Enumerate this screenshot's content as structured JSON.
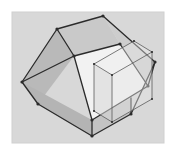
{
  "figure": {
    "title": "3D wireframe illustration of an open box with a smaller transparent box",
    "type": "3d-line-drawing",
    "width": 177,
    "height": 155,
    "background_color": "#ffffff",
    "plot_background_color": "#d9d9d9",
    "frame": {
      "x": 12,
      "y": 12,
      "width": 152,
      "height": 131,
      "fill": "#d8d8d8",
      "border_color": "#d0d0d0"
    },
    "stroke": {
      "color": "#2b2b2b",
      "width": 1.3,
      "thin_color": "#5a5a5a",
      "thin_width": 0.8
    },
    "shapes": [
      {
        "name": "large-open-box",
        "label": "Large open box",
        "faces": [
          {
            "name": "outer-left-face",
            "fill": "#b9b9b9",
            "points": "22,82 57,29 74,56 38,104"
          },
          {
            "name": "outer-front-left-face",
            "fill": "#b4b4b4",
            "points": "22,82 38,104 92,136 92,120"
          },
          {
            "name": "inner-back-left-wall",
            "fill": "#c9c9c9",
            "points": "57,29 103,16 120,44 74,56"
          },
          {
            "name": "inner-floor",
            "fill": "#f2f2f2",
            "points": "74,56 120,44 148,86 92,120"
          },
          {
            "name": "outer-right-face",
            "fill": "#cdcdcd",
            "points": "103,16 120,44 148,86 155,62"
          },
          {
            "name": "inner-front-right-wall",
            "fill": "#d5d5d5",
            "points": "92,120 148,86 155,62 131,114"
          },
          {
            "name": "front-bottom-face",
            "fill": "#c3c3c3",
            "points": "92,120 92,136 131,114 131,98"
          }
        ],
        "edges": [
          {
            "name": "top-rim-back-left",
            "from": "57,29",
            "to": "103,16"
          },
          {
            "name": "top-rim-back-right",
            "from": "103,16",
            "to": "155,62"
          },
          {
            "name": "top-rim-front-left",
            "from": "22,82",
            "to": "57,29"
          },
          {
            "name": "top-rim-front-right",
            "from": "155,62",
            "to": "131,114"
          },
          {
            "name": "inner-rim-left",
            "from": "74,56",
            "to": "120,44"
          },
          {
            "name": "inner-rim-right",
            "from": "120,44",
            "to": "148,86"
          },
          {
            "name": "inner-rim-front-l",
            "from": "74,56",
            "to": "92,120"
          },
          {
            "name": "inner-rim-front-r",
            "from": "148,86",
            "to": "92,120"
          },
          {
            "name": "corner-vert-left",
            "from": "22,82",
            "to": "38,104"
          },
          {
            "name": "corner-vert-front",
            "from": "92,120",
            "to": "92,136"
          },
          {
            "name": "corner-vert-right",
            "from": "131,98",
            "to": "131,114"
          },
          {
            "name": "bottom-edge-left",
            "from": "38,104",
            "to": "92,136"
          },
          {
            "name": "bottom-edge-right",
            "from": "92,136",
            "to": "131,114"
          },
          {
            "name": "wall-thickness-l",
            "from": "57,29",
            "to": "74,56"
          },
          {
            "name": "wall-thickness-r",
            "from": "155,62",
            "to": "148,86"
          },
          {
            "name": "wall-thickness-bl",
            "from": "22,82",
            "to": "74,56"
          }
        ],
        "vertices": [
          {
            "name": "v-top-apex",
            "x": 103,
            "y": 16
          },
          {
            "name": "v-top-left",
            "x": 57,
            "y": 29
          },
          {
            "name": "v-left",
            "x": 22,
            "y": 82
          },
          {
            "name": "v-left-lower",
            "x": 38,
            "y": 104
          },
          {
            "name": "v-bottom",
            "x": 92,
            "y": 136
          },
          {
            "name": "v-front",
            "x": 92,
            "y": 120
          },
          {
            "name": "v-right",
            "x": 155,
            "y": 62
          },
          {
            "name": "v-right-lower",
            "x": 131,
            "y": 114
          },
          {
            "name": "v-inner-left",
            "x": 74,
            "y": 56
          },
          {
            "name": "v-inner-top",
            "x": 120,
            "y": 44
          },
          {
            "name": "v-inner-right",
            "x": 148,
            "y": 86
          }
        ]
      },
      {
        "name": "small-transparent-box",
        "label": "Small transparent box",
        "faces": [
          {
            "name": "small-left-face",
            "fill": "rgba(215,215,215,0.55)",
            "points": "94,64 94,111 112,122 112,75"
          },
          {
            "name": "small-front-face",
            "fill": "rgba(228,228,228,0.45)",
            "points": "112,75 112,122 152,99 152,52"
          },
          {
            "name": "small-top-face",
            "fill": "rgba(238,238,238,0.40)",
            "points": "94,64 112,75 152,52 134,41"
          }
        ],
        "edges": [
          {
            "name": "s-top-back-left",
            "from": "94,64",
            "to": "134,41"
          },
          {
            "name": "s-top-back-right",
            "from": "134,41",
            "to": "152,52"
          },
          {
            "name": "s-top-front-left",
            "from": "94,64",
            "to": "112,75"
          },
          {
            "name": "s-top-front-right",
            "from": "112,75",
            "to": "152,52"
          },
          {
            "name": "s-vert-left",
            "from": "94,64",
            "to": "94,111"
          },
          {
            "name": "s-vert-front",
            "from": "112,75",
            "to": "112,122"
          },
          {
            "name": "s-vert-right",
            "from": "152,52",
            "to": "152,99"
          },
          {
            "name": "s-bottom-left",
            "from": "94,111",
            "to": "112,122"
          },
          {
            "name": "s-bottom-right",
            "from": "112,122",
            "to": "152,99"
          }
        ],
        "vertices": [
          {
            "name": "s-v-back-left",
            "x": 94,
            "y": 64
          },
          {
            "name": "s-v-back-top",
            "x": 134,
            "y": 41
          },
          {
            "name": "s-v-back-right",
            "x": 152,
            "y": 52
          },
          {
            "name": "s-v-front",
            "x": 112,
            "y": 75
          },
          {
            "name": "s-v-front-low",
            "x": 112,
            "y": 122
          },
          {
            "name": "s-v-left-low",
            "x": 94,
            "y": 111
          },
          {
            "name": "s-v-right-low",
            "x": 152,
            "y": 99
          }
        ]
      }
    ]
  }
}
